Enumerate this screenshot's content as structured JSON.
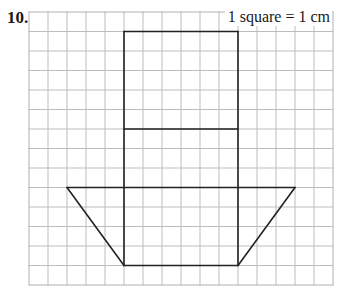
{
  "question": {
    "number": "10."
  },
  "scale": {
    "label": "1 square = 1 cm"
  },
  "grid": {
    "origin_px": [
      29,
      12
    ],
    "cell_w_px": 19,
    "cell_h_px": 19.5,
    "cols": 16,
    "rows": 14,
    "line_color": "#bdbdbd",
    "border_color": "#b0b0b0"
  },
  "shapes": {
    "stroke_color": "#222222",
    "stroke_width": 1.6,
    "rectangle": {
      "col_left": 5,
      "col_right": 11,
      "row_top": 1,
      "row_bottom": 13
    },
    "divider_line": {
      "row": 6,
      "col_left": 5,
      "col_right": 11
    },
    "trapezoid": {
      "top": {
        "row": 9,
        "col_left": 2,
        "col_right": 14
      },
      "bottom": {
        "row": 13,
        "col_left": 5,
        "col_right": 11
      }
    }
  }
}
